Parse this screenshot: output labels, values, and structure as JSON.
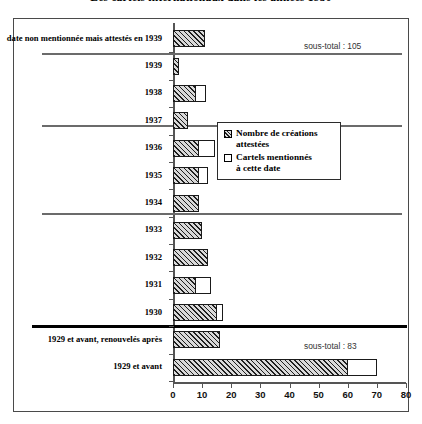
{
  "title": "Les cartels internationaux dans les années 1930",
  "legend": {
    "position": "middle-right",
    "items": [
      {
        "key": "hatched",
        "label_line1": "Nombre de créations",
        "label_line2": "attestées"
      },
      {
        "key": "outline",
        "label_line1": "Cartels mentionnés",
        "label_line2": "à cette date"
      }
    ]
  },
  "subtotals": [
    {
      "name": "subtotal-top",
      "text": "sous-total : 105"
    },
    {
      "name": "subtotal-bottom",
      "text": "sous-total : 83"
    }
  ],
  "chart_data": {
    "type": "bar",
    "orientation": "horizontal",
    "title": "Les cartels internationaux dans les années 1930",
    "xlabel": "",
    "ylabel": "",
    "xlim": [
      0,
      80
    ],
    "xticks": [
      0,
      10,
      20,
      30,
      40,
      50,
      60,
      70,
      80
    ],
    "ticklabels": [
      "0",
      "10",
      "20",
      "30",
      "40",
      "50",
      "60",
      "70",
      "80"
    ],
    "grid": false,
    "legend_position": "middle-right",
    "categories": [
      "date non mentionnée mais attestés en 1939",
      "1939",
      "1938",
      "1937",
      "1936",
      "1935",
      "1934",
      "1933",
      "1932",
      "1931",
      "1930",
      "1929 et avant, renouvelés après",
      "1929 et avant"
    ],
    "series": [
      {
        "name": "Nombre de créations attestées",
        "style": "hatched",
        "values": [
          11,
          2,
          8,
          5,
          9,
          9,
          9,
          10,
          12,
          8,
          15,
          16,
          60
        ]
      },
      {
        "name": "Cartels mentionnés à cette date",
        "style": "outline",
        "values": [
          11,
          2,
          11.5,
          5,
          14.5,
          12,
          9,
          10,
          12,
          13,
          17,
          16,
          70
        ]
      }
    ],
    "annotations": [
      {
        "text": "sous-total : 105",
        "section": "1930-1939"
      },
      {
        "text": "sous-total : 83",
        "section": "1929 et avant"
      }
    ]
  }
}
